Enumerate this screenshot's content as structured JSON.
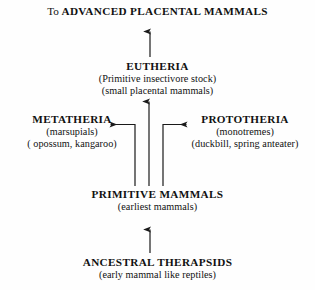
{
  "diagram": {
    "background_color": "#fefefe",
    "line_color": "#1a1a1a",
    "text_color": "#111111"
  },
  "nodes": {
    "advanced_placental": {
      "lead": "To",
      "taxon": "ADVANCED PLACENTAL MAMMALS"
    },
    "eutheria": {
      "taxon": "EUTHERIA",
      "desc1": "(Primitive insectivore stock)",
      "desc2": "(small placental mammals)"
    },
    "metatheria": {
      "taxon": "METATHERIA",
      "desc1": "(marsupials)",
      "desc2": "( opossum, kangaroo)"
    },
    "prototheria": {
      "taxon": "PROTOTHERIA",
      "desc1": "(monotremes)",
      "desc2": "(duckbill,  spring anteater)"
    },
    "primitive_mammals": {
      "taxon": "PRIMITIVE MAMMALS",
      "desc1": "(earliest mammals)"
    },
    "ancestral_therapsids": {
      "taxon": "ANCESTRAL THERAPSIDS",
      "desc1": "(early mammal like reptiles)"
    }
  },
  "arrows": [
    {
      "name": "arrow-eutheria-to-advanced",
      "direction": "up"
    },
    {
      "name": "arrow-primitive-to-eutheria",
      "direction": "up"
    },
    {
      "name": "arrow-primitive-to-metatheria",
      "direction": "left"
    },
    {
      "name": "arrow-primitive-to-prototheria",
      "direction": "right"
    },
    {
      "name": "arrow-ancestral-to-primitive",
      "direction": "up"
    }
  ]
}
